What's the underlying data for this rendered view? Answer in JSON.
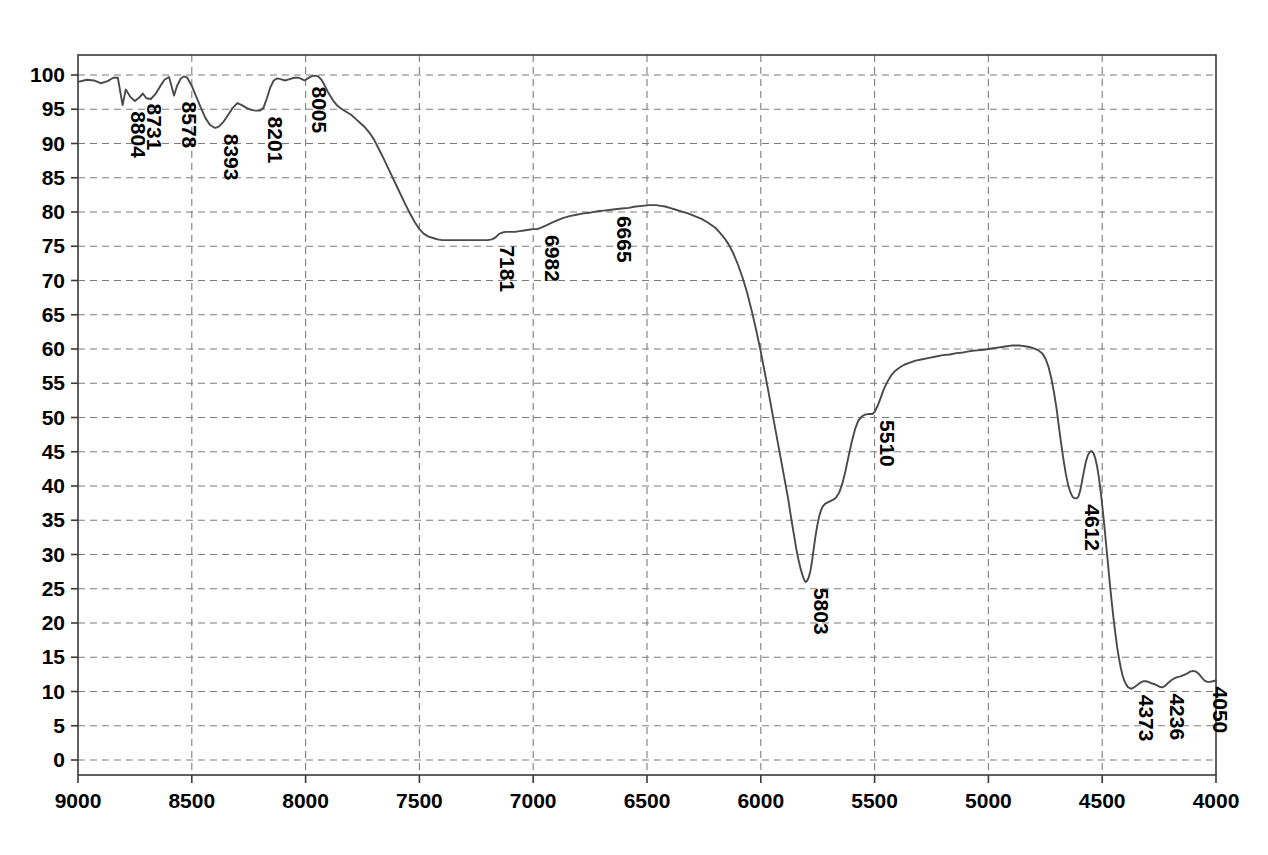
{
  "chart_data": {
    "type": "line",
    "title": "",
    "subtitle": "",
    "xlabel": "",
    "ylabel": "",
    "xlim": [
      9000,
      4000
    ],
    "ylim": [
      0,
      100
    ],
    "x_axis_reversed": true,
    "grid": true,
    "legend": null,
    "legend_position": "none",
    "x_ticks": [
      9000,
      8500,
      8000,
      7500,
      7000,
      6500,
      6000,
      5500,
      5000,
      4500,
      4000
    ],
    "y_ticks": [
      0,
      5,
      10,
      15,
      20,
      25,
      30,
      35,
      40,
      45,
      50,
      55,
      60,
      65,
      70,
      75,
      80,
      85,
      90,
      95,
      100
    ],
    "trace_color": "#4a4a4a",
    "grid_color": "#7d7d7d",
    "frame_color": "#3a3a3a",
    "annotations": [
      {
        "label": "8804",
        "x": 8804,
        "y": 95.6
      },
      {
        "label": "8731",
        "x": 8731,
        "y": 96.7
      },
      {
        "label": "8578",
        "x": 8578,
        "y": 97.0
      },
      {
        "label": "8393",
        "x": 8393,
        "y": 92.3
      },
      {
        "label": "8201",
        "x": 8201,
        "y": 94.8
      },
      {
        "label": "8005",
        "x": 8005,
        "y": 99.2
      },
      {
        "label": "7181",
        "x": 7181,
        "y": 76.0
      },
      {
        "label": "6982",
        "x": 6982,
        "y": 77.5
      },
      {
        "label": "6665",
        "x": 6665,
        "y": 80.3
      },
      {
        "label": "5803",
        "x": 5803,
        "y": 26.0
      },
      {
        "label": "5510",
        "x": 5510,
        "y": 50.5
      },
      {
        "label": "4612",
        "x": 4612,
        "y": 38.2
      },
      {
        "label": "4373",
        "x": 4373,
        "y": 10.4
      },
      {
        "label": "4236",
        "x": 4236,
        "y": 10.6
      },
      {
        "label": "4050",
        "x": 4050,
        "y": 11.6
      }
    ],
    "series": [
      {
        "name": "transmittance",
        "points": [
          [
            9000,
            99.0
          ],
          [
            8960,
            99.3
          ],
          [
            8930,
            99.2
          ],
          [
            8900,
            98.8
          ],
          [
            8870,
            99.1
          ],
          [
            8845,
            99.6
          ],
          [
            8825,
            99.6
          ],
          [
            8804,
            95.6
          ],
          [
            8790,
            97.9
          ],
          [
            8770,
            96.8
          ],
          [
            8750,
            96.2
          ],
          [
            8731,
            96.7
          ],
          [
            8715,
            97.3
          ],
          [
            8700,
            96.6
          ],
          [
            8680,
            96.5
          ],
          [
            8660,
            97.2
          ],
          [
            8640,
            98.3
          ],
          [
            8620,
            99.3
          ],
          [
            8600,
            99.7
          ],
          [
            8578,
            97.0
          ],
          [
            8565,
            98.4
          ],
          [
            8550,
            99.4
          ],
          [
            8535,
            99.8
          ],
          [
            8520,
            99.6
          ],
          [
            8500,
            98.4
          ],
          [
            8480,
            96.8
          ],
          [
            8460,
            95.2
          ],
          [
            8440,
            93.7
          ],
          [
            8420,
            92.7
          ],
          [
            8400,
            92.3
          ],
          [
            8393,
            92.3
          ],
          [
            8380,
            92.5
          ],
          [
            8360,
            93.2
          ],
          [
            8340,
            94.2
          ],
          [
            8320,
            95.2
          ],
          [
            8300,
            95.9
          ],
          [
            8280,
            95.6
          ],
          [
            8260,
            95.2
          ],
          [
            8240,
            94.9
          ],
          [
            8220,
            94.8
          ],
          [
            8201,
            94.8
          ],
          [
            8185,
            95.2
          ],
          [
            8170,
            96.6
          ],
          [
            8155,
            98.2
          ],
          [
            8140,
            99.2
          ],
          [
            8125,
            99.5
          ],
          [
            8110,
            99.4
          ],
          [
            8090,
            99.2
          ],
          [
            8070,
            99.4
          ],
          [
            8050,
            99.6
          ],
          [
            8030,
            99.6
          ],
          [
            8005,
            99.2
          ],
          [
            7990,
            99.5
          ],
          [
            7975,
            99.8
          ],
          [
            7960,
            99.9
          ],
          [
            7945,
            99.8
          ],
          [
            7930,
            99.3
          ],
          [
            7915,
            98.4
          ],
          [
            7900,
            97.4
          ],
          [
            7880,
            96.3
          ],
          [
            7860,
            95.5
          ],
          [
            7840,
            95.0
          ],
          [
            7820,
            94.6
          ],
          [
            7800,
            94.2
          ],
          [
            7780,
            93.6
          ],
          [
            7760,
            93.0
          ],
          [
            7740,
            92.4
          ],
          [
            7720,
            91.6
          ],
          [
            7700,
            90.6
          ],
          [
            7680,
            89.3
          ],
          [
            7660,
            88.0
          ],
          [
            7640,
            86.6
          ],
          [
            7620,
            85.2
          ],
          [
            7600,
            83.8
          ],
          [
            7580,
            82.4
          ],
          [
            7560,
            81.0
          ],
          [
            7540,
            79.7
          ],
          [
            7520,
            78.5
          ],
          [
            7500,
            77.5
          ],
          [
            7480,
            76.8
          ],
          [
            7460,
            76.4
          ],
          [
            7440,
            76.2
          ],
          [
            7420,
            76.0
          ],
          [
            7400,
            75.9
          ],
          [
            7380,
            75.9
          ],
          [
            7360,
            75.9
          ],
          [
            7340,
            75.9
          ],
          [
            7320,
            75.9
          ],
          [
            7300,
            75.9
          ],
          [
            7280,
            75.9
          ],
          [
            7260,
            75.9
          ],
          [
            7240,
            75.9
          ],
          [
            7220,
            75.9
          ],
          [
            7200,
            75.9
          ],
          [
            7181,
            76.0
          ],
          [
            7165,
            76.3
          ],
          [
            7150,
            76.8
          ],
          [
            7135,
            77.0
          ],
          [
            7120,
            77.1
          ],
          [
            7100,
            77.1
          ],
          [
            7080,
            77.1
          ],
          [
            7060,
            77.2
          ],
          [
            7040,
            77.3
          ],
          [
            7020,
            77.4
          ],
          [
            7000,
            77.5
          ],
          [
            6982,
            77.5
          ],
          [
            6960,
            77.8
          ],
          [
            6940,
            78.1
          ],
          [
            6920,
            78.4
          ],
          [
            6900,
            78.7
          ],
          [
            6870,
            79.1
          ],
          [
            6840,
            79.4
          ],
          [
            6810,
            79.6
          ],
          [
            6780,
            79.8
          ],
          [
            6750,
            79.9
          ],
          [
            6720,
            80.1
          ],
          [
            6690,
            80.2
          ],
          [
            6665,
            80.3
          ],
          [
            6640,
            80.4
          ],
          [
            6610,
            80.5
          ],
          [
            6580,
            80.6
          ],
          [
            6550,
            80.8
          ],
          [
            6520,
            80.9
          ],
          [
            6490,
            81.0
          ],
          [
            6460,
            81.0
          ],
          [
            6440,
            80.9
          ],
          [
            6420,
            80.8
          ],
          [
            6400,
            80.6
          ],
          [
            6380,
            80.4
          ],
          [
            6350,
            80.1
          ],
          [
            6320,
            79.8
          ],
          [
            6290,
            79.4
          ],
          [
            6260,
            79.0
          ],
          [
            6230,
            78.4
          ],
          [
            6200,
            77.7
          ],
          [
            6180,
            77.0
          ],
          [
            6160,
            76.2
          ],
          [
            6140,
            75.2
          ],
          [
            6120,
            73.9
          ],
          [
            6100,
            72.3
          ],
          [
            6080,
            70.4
          ],
          [
            6060,
            68.2
          ],
          [
            6040,
            65.6
          ],
          [
            6020,
            62.7
          ],
          [
            6000,
            59.6
          ],
          [
            5985,
            57.0
          ],
          [
            5970,
            54.4
          ],
          [
            5955,
            51.7
          ],
          [
            5940,
            49.0
          ],
          [
            5925,
            46.3
          ],
          [
            5910,
            43.6
          ],
          [
            5895,
            40.9
          ],
          [
            5880,
            38.2
          ],
          [
            5868,
            35.6
          ],
          [
            5856,
            33.2
          ],
          [
            5845,
            31.0
          ],
          [
            5835,
            29.3
          ],
          [
            5825,
            27.9
          ],
          [
            5815,
            26.8
          ],
          [
            5808,
            26.2
          ],
          [
            5803,
            26.0
          ],
          [
            5798,
            26.1
          ],
          [
            5790,
            26.6
          ],
          [
            5782,
            27.6
          ],
          [
            5775,
            29.0
          ],
          [
            5768,
            30.7
          ],
          [
            5760,
            32.6
          ],
          [
            5752,
            34.2
          ],
          [
            5744,
            35.5
          ],
          [
            5736,
            36.4
          ],
          [
            5728,
            37.0
          ],
          [
            5718,
            37.4
          ],
          [
            5706,
            37.6
          ],
          [
            5694,
            37.8
          ],
          [
            5682,
            38.0
          ],
          [
            5670,
            38.3
          ],
          [
            5656,
            39.0
          ],
          [
            5642,
            40.3
          ],
          [
            5628,
            42.2
          ],
          [
            5614,
            44.4
          ],
          [
            5600,
            46.5
          ],
          [
            5586,
            48.3
          ],
          [
            5572,
            49.5
          ],
          [
            5558,
            50.1
          ],
          [
            5544,
            50.4
          ],
          [
            5530,
            50.5
          ],
          [
            5518,
            50.5
          ],
          [
            5510,
            50.5
          ],
          [
            5500,
            50.8
          ],
          [
            5488,
            51.6
          ],
          [
            5474,
            52.8
          ],
          [
            5460,
            54.1
          ],
          [
            5444,
            55.2
          ],
          [
            5428,
            56.1
          ],
          [
            5410,
            56.8
          ],
          [
            5390,
            57.3
          ],
          [
            5370,
            57.7
          ],
          [
            5345,
            58.0
          ],
          [
            5320,
            58.3
          ],
          [
            5290,
            58.5
          ],
          [
            5260,
            58.7
          ],
          [
            5230,
            58.9
          ],
          [
            5200,
            59.1
          ],
          [
            5170,
            59.2
          ],
          [
            5140,
            59.4
          ],
          [
            5110,
            59.5
          ],
          [
            5080,
            59.7
          ],
          [
            5050,
            59.8
          ],
          [
            5020,
            59.9
          ],
          [
            5000,
            60.0
          ],
          [
            4980,
            60.1
          ],
          [
            4960,
            60.2
          ],
          [
            4940,
            60.3
          ],
          [
            4920,
            60.4
          ],
          [
            4900,
            60.5
          ],
          [
            4880,
            60.5
          ],
          [
            4860,
            60.5
          ],
          [
            4840,
            60.4
          ],
          [
            4820,
            60.3
          ],
          [
            4800,
            60.1
          ],
          [
            4780,
            59.8
          ],
          [
            4762,
            59.3
          ],
          [
            4748,
            58.5
          ],
          [
            4736,
            57.4
          ],
          [
            4724,
            55.8
          ],
          [
            4712,
            53.7
          ],
          [
            4700,
            51.2
          ],
          [
            4690,
            48.6
          ],
          [
            4680,
            46.1
          ],
          [
            4670,
            43.8
          ],
          [
            4660,
            41.8
          ],
          [
            4650,
            40.2
          ],
          [
            4640,
            39.1
          ],
          [
            4630,
            38.4
          ],
          [
            4620,
            38.2
          ],
          [
            4612,
            38.2
          ],
          [
            4604,
            38.5
          ],
          [
            4596,
            39.4
          ],
          [
            4588,
            40.8
          ],
          [
            4580,
            42.2
          ],
          [
            4572,
            43.5
          ],
          [
            4563,
            44.5
          ],
          [
            4554,
            45.0
          ],
          [
            4546,
            45.1
          ],
          [
            4538,
            44.8
          ],
          [
            4530,
            44.0
          ],
          [
            4522,
            42.8
          ],
          [
            4514,
            41.1
          ],
          [
            4506,
            39.0
          ],
          [
            4498,
            36.6
          ],
          [
            4490,
            34.0
          ],
          [
            4482,
            31.2
          ],
          [
            4474,
            28.4
          ],
          [
            4466,
            25.6
          ],
          [
            4458,
            23.0
          ],
          [
            4450,
            20.6
          ],
          [
            4442,
            18.4
          ],
          [
            4434,
            16.4
          ],
          [
            4426,
            14.8
          ],
          [
            4418,
            13.4
          ],
          [
            4410,
            12.3
          ],
          [
            4402,
            11.5
          ],
          [
            4394,
            11.0
          ],
          [
            4386,
            10.6
          ],
          [
            4378,
            10.5
          ],
          [
            4373,
            10.4
          ],
          [
            4366,
            10.5
          ],
          [
            4356,
            10.7
          ],
          [
            4344,
            11.0
          ],
          [
            4332,
            11.3
          ],
          [
            4320,
            11.5
          ],
          [
            4308,
            11.5
          ],
          [
            4296,
            11.4
          ],
          [
            4284,
            11.2
          ],
          [
            4272,
            11.1
          ],
          [
            4260,
            10.9
          ],
          [
            4248,
            10.7
          ],
          [
            4236,
            10.6
          ],
          [
            4224,
            10.8
          ],
          [
            4212,
            11.2
          ],
          [
            4198,
            11.6
          ],
          [
            4184,
            11.9
          ],
          [
            4170,
            12.1
          ],
          [
            4156,
            12.2
          ],
          [
            4142,
            12.4
          ],
          [
            4128,
            12.6
          ],
          [
            4114,
            12.9
          ],
          [
            4100,
            13.0
          ],
          [
            4088,
            12.9
          ],
          [
            4076,
            12.6
          ],
          [
            4064,
            12.1
          ],
          [
            4050,
            11.6
          ],
          [
            4038,
            11.4
          ],
          [
            4026,
            11.4
          ],
          [
            4014,
            11.5
          ],
          [
            4000,
            11.6
          ]
        ]
      }
    ]
  }
}
